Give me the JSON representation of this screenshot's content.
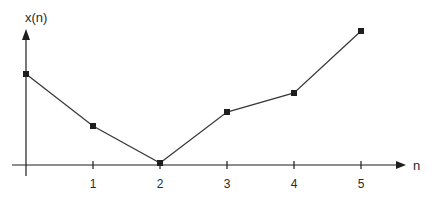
{
  "chart_data": {
    "type": "line",
    "title": "",
    "xlabel": "n",
    "ylabel": "x(n)",
    "x": [
      0,
      1,
      2,
      3,
      4,
      5
    ],
    "x_tick_labels": [
      "1",
      "2",
      "3",
      "4",
      "5"
    ],
    "x_ticks": [
      1,
      2,
      3,
      4,
      5
    ],
    "series": [
      {
        "name": "x(n)",
        "values": [
          9.1,
          3.9,
          0.2,
          5.3,
          7.2,
          13.4
        ],
        "marker": "square"
      }
    ],
    "y_tick_labels": [],
    "xlim": [
      0,
      5.6
    ],
    "ylim": [
      0,
      13.5
    ],
    "grid": false,
    "legend": "none",
    "note": "y-axis unlabeled; values are relative estimates",
    "colors": {
      "line": "#3a3a3a",
      "axis": "#1e1e1e",
      "marker": "#1e1e1e"
    }
  }
}
